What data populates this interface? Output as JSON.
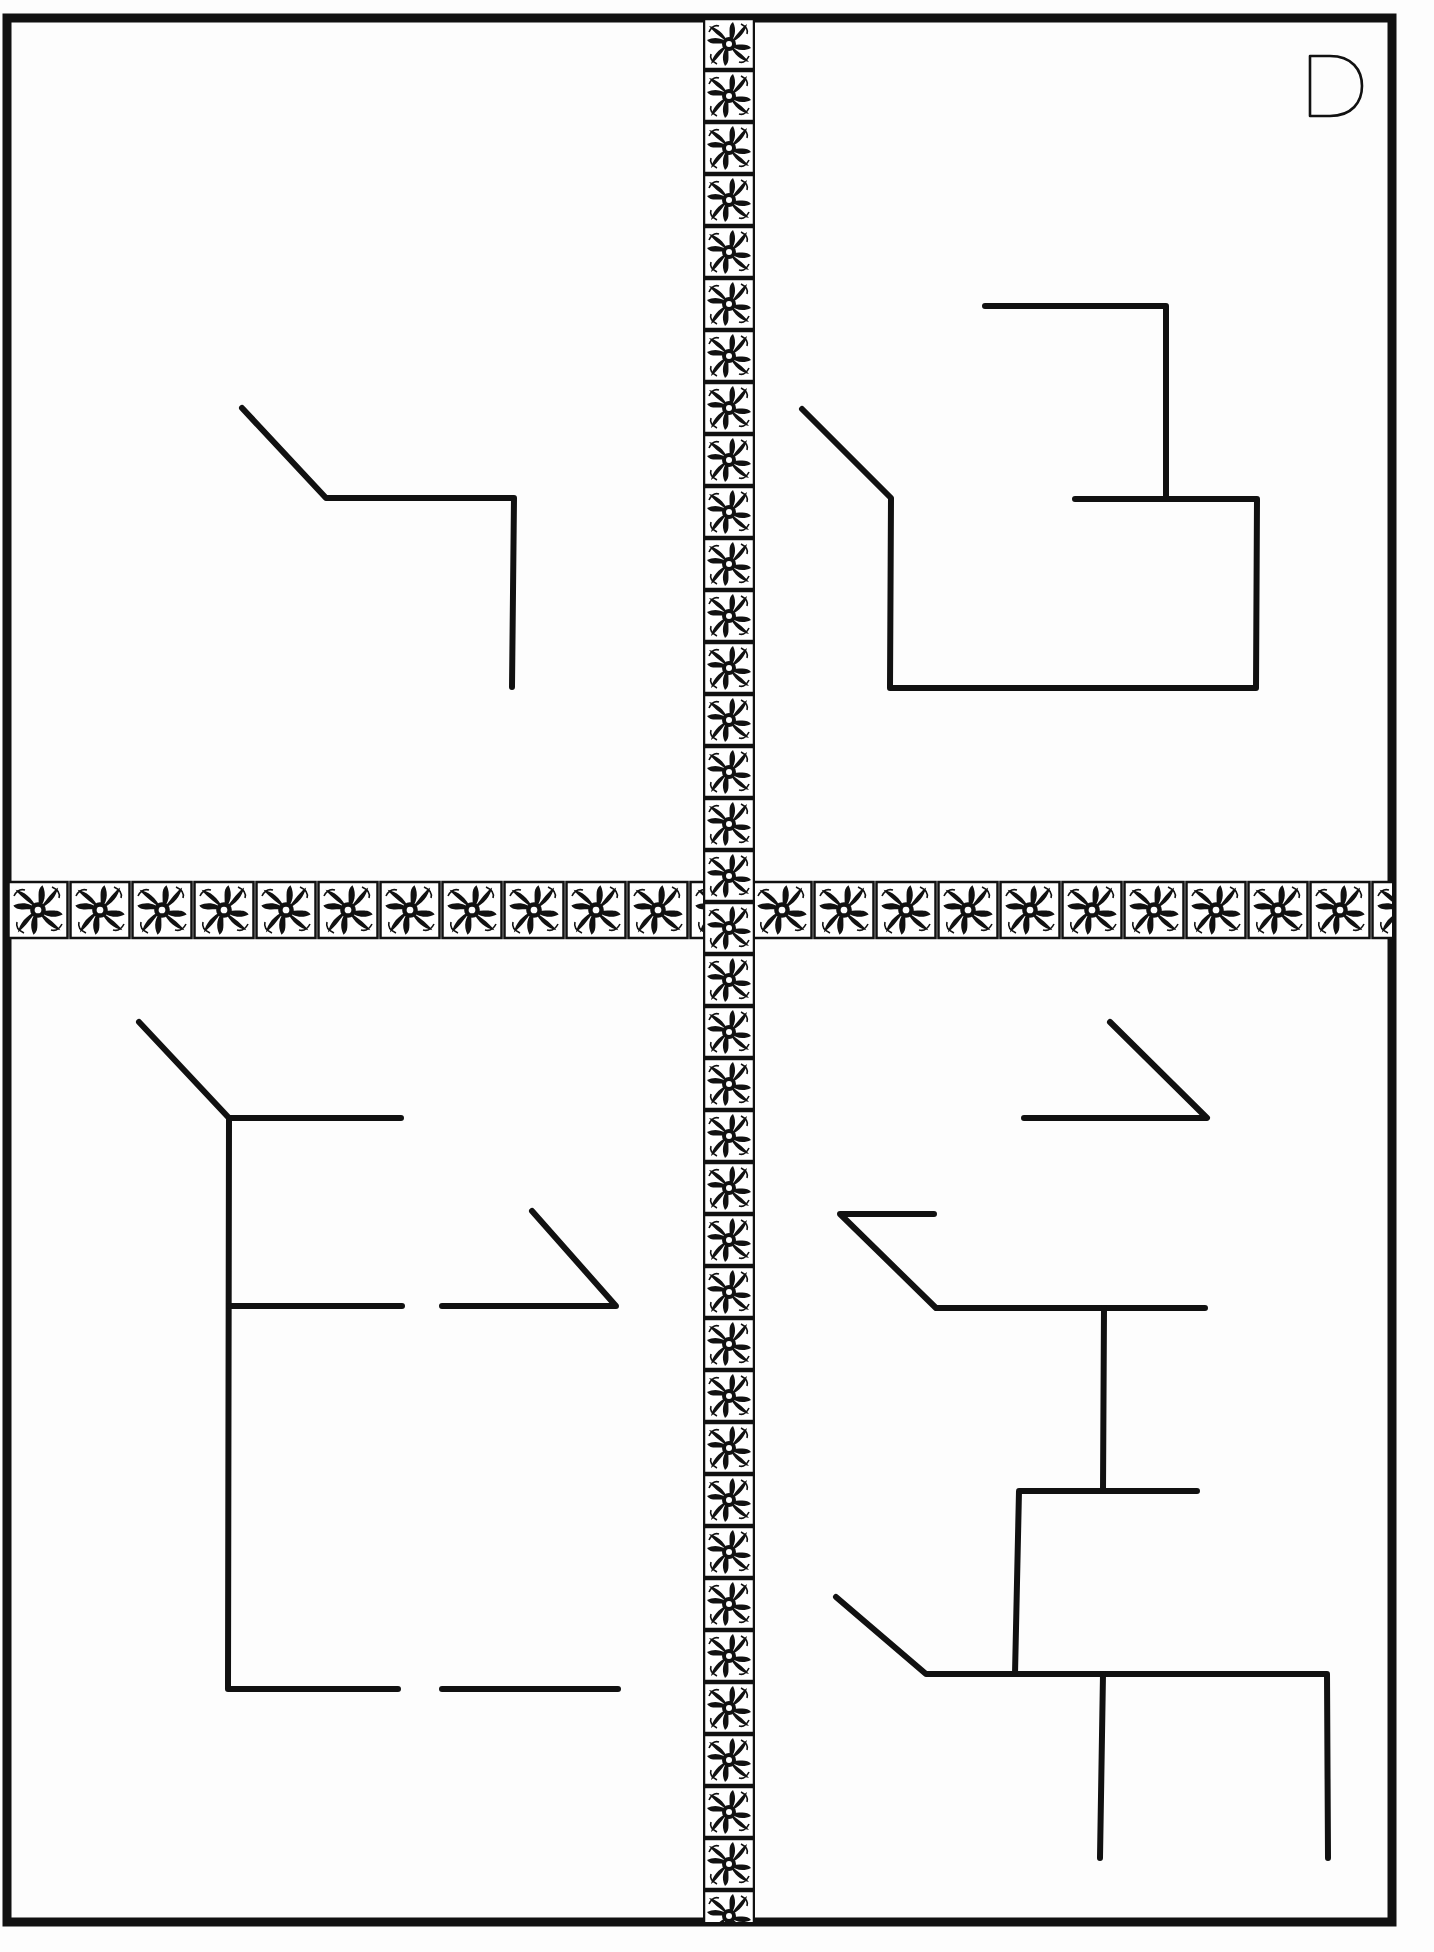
{
  "page": {
    "label": "D",
    "background": "#fdfdfd",
    "ink": "#111111"
  },
  "frame": {
    "left": 7,
    "top": 18,
    "right": 1392,
    "bottom": 1922,
    "stroke_width": 9
  },
  "ornament": {
    "name": "acanthus-rosette-tile",
    "vertical_band": {
      "x": 703,
      "width": 52,
      "y_start": 18,
      "y_end": 1922,
      "tile_size": 52
    },
    "horizontal_band": {
      "y": 880,
      "height": 60,
      "x_start": 7,
      "x_end": 1392,
      "tile_size": 62
    }
  },
  "quadrants": [
    {
      "id": "top-left",
      "figure": {
        "polylines": [
          [
            [
              242,
              408
            ],
            [
              326,
              498
            ],
            [
              514,
              498
            ],
            [
              512,
              687
            ]
          ]
        ]
      }
    },
    {
      "id": "top-right",
      "figure": {
        "polylines": [
          [
            [
              985,
              306
            ],
            [
              1166,
              306
            ],
            [
              1166,
              499
            ]
          ],
          [
            [
              1075,
              499
            ],
            [
              1257,
              499
            ],
            [
              1256,
              688
            ],
            [
              890,
              688
            ],
            [
              891,
              498
            ],
            [
              802,
              409
            ]
          ]
        ]
      }
    },
    {
      "id": "bottom-left",
      "figure": {
        "polylines": [
          [
            [
              139,
              1022
            ],
            [
              229,
              1118
            ],
            [
              401,
              1118
            ]
          ],
          [
            [
              229,
              1118
            ],
            [
              228,
              1689
            ],
            [
              398,
              1689
            ]
          ],
          [
            [
              229,
              1306
            ],
            [
              402,
              1306
            ]
          ],
          [
            [
              442,
              1306
            ],
            [
              616,
              1306
            ],
            [
              532,
              1211
            ]
          ],
          [
            [
              442,
              1689
            ],
            [
              618,
              1689
            ]
          ]
        ]
      }
    },
    {
      "id": "bottom-right",
      "figure": {
        "polylines": [
          [
            [
              1110,
              1022
            ],
            [
              1207,
              1118
            ],
            [
              1024,
              1118
            ]
          ],
          [
            [
              934,
              1214
            ],
            [
              840,
              1214
            ],
            [
              936,
              1308
            ],
            [
              1205,
              1308
            ]
          ],
          [
            [
              1104,
              1308
            ],
            [
              1103,
              1490
            ]
          ],
          [
            [
              1197,
              1491
            ],
            [
              1019,
              1491
            ],
            [
              1015,
              1674
            ]
          ],
          [
            [
              836,
              1597
            ],
            [
              926,
              1674
            ],
            [
              1327,
              1674
            ],
            [
              1328,
              1858
            ]
          ],
          [
            [
              1103,
              1674
            ],
            [
              1100,
              1858
            ]
          ]
        ]
      }
    }
  ]
}
